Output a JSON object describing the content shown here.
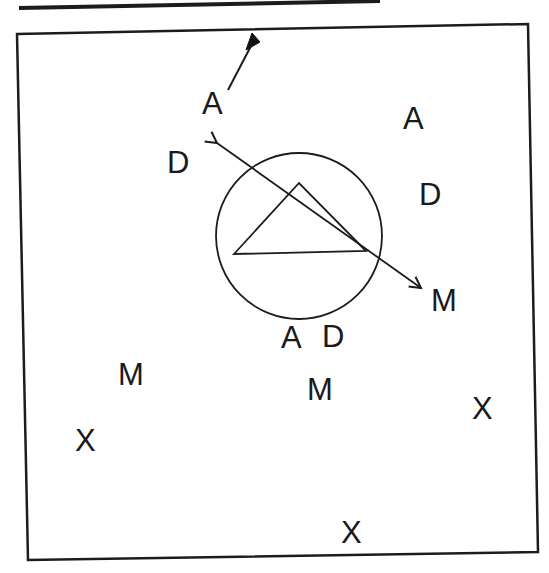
{
  "diagram": {
    "colors": {
      "ink": "#1c1c1c",
      "background": "#ffffff"
    },
    "labels": [
      {
        "id": "A1",
        "text": "A",
        "x": 202,
        "y": 114
      },
      {
        "id": "A2",
        "text": "A",
        "x": 403,
        "y": 129
      },
      {
        "id": "D1",
        "text": "D",
        "x": 167,
        "y": 173
      },
      {
        "id": "D2",
        "text": "D",
        "x": 419,
        "y": 205
      },
      {
        "id": "M1",
        "text": "M",
        "x": 431,
        "y": 311
      },
      {
        "id": "A3",
        "text": "A",
        "x": 281,
        "y": 348
      },
      {
        "id": "D3",
        "text": "D",
        "x": 322,
        "y": 347
      },
      {
        "id": "M2",
        "text": "M",
        "x": 118,
        "y": 385
      },
      {
        "id": "M3",
        "text": "M",
        "x": 307,
        "y": 400
      },
      {
        "id": "X1",
        "text": "X",
        "x": 472,
        "y": 419
      },
      {
        "id": "X2",
        "text": "X",
        "x": 75,
        "y": 451
      },
      {
        "id": "X3",
        "text": "X",
        "x": 341,
        "y": 543
      }
    ],
    "shapes": {
      "frame_corners": [
        [
          17,
          34
        ],
        [
          528,
          24
        ],
        [
          538,
          552
        ],
        [
          28,
          560
        ]
      ],
      "top_rule": {
        "x1": 19,
        "y1": 8,
        "x2": 380,
        "y2": 1
      },
      "circle": {
        "cx": 299,
        "cy": 236,
        "r": 83
      },
      "triangle": [
        [
          234,
          254
        ],
        [
          299,
          183
        ],
        [
          366,
          251
        ]
      ],
      "double_arrow": {
        "x1": 217,
        "y1": 143,
        "x2": 421,
        "y2": 288
      },
      "flag_pole": {
        "x1": 228,
        "y1": 90,
        "x2": 251,
        "y2": 46
      },
      "flag": [
        [
          246,
          50
        ],
        [
          252,
          33
        ],
        [
          260,
          42
        ]
      ]
    }
  }
}
